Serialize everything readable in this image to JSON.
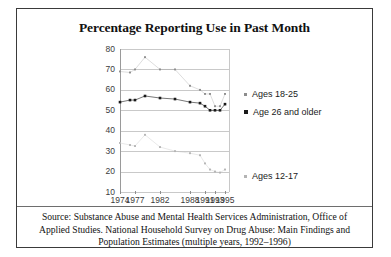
{
  "figure": {
    "title": "Percentage Reporting Use in Past Month"
  },
  "axes": {
    "y_ticks": [
      "80",
      "70",
      "60",
      "50",
      "40",
      "30",
      "20",
      "10"
    ],
    "x_ticks": [
      "1974",
      "1977",
      "1982",
      "1988",
      "1991",
      "1993",
      "1995"
    ]
  },
  "legend": {
    "items": [
      {
        "label": "Ages 18-25",
        "color": "#8c8c8c"
      },
      {
        "label": "Age 26 and older",
        "color": "#1a1a1a"
      },
      {
        "label": "Ages 12-17",
        "color": "#b4b4b4"
      }
    ]
  },
  "source": {
    "line1": "Source: Substance Abuse and Mental Health Services Administration, Office of",
    "line2": "Applied Studies.  National Household Survey on Drug Abuse: Main Findings and",
    "line3": "Population Estimates (multiple years, 1992–1996)"
  },
  "chart_data": {
    "type": "line",
    "title": "Percentage Reporting Use in Past Month",
    "xlabel": "",
    "ylabel": "",
    "xlim": [
      1974,
      1996
    ],
    "ylim": [
      10,
      80
    ],
    "ytick_step": 10,
    "grid": true,
    "legend_position": "right",
    "x": [
      1974,
      1976,
      1977,
      1979,
      1982,
      1985,
      1988,
      1990,
      1991,
      1992,
      1993,
      1994,
      1995
    ],
    "series": [
      {
        "name": "Ages 18-25",
        "color": "#8c8c8c",
        "marker": "square-small",
        "values": [
          69,
          68.5,
          70,
          76,
          70,
          70,
          62,
          60,
          58,
          58,
          52,
          52,
          58
        ]
      },
      {
        "name": "Age 26 and older",
        "color": "#1a1a1a",
        "marker": "square-filled",
        "values": [
          54,
          55,
          55,
          57,
          56,
          55.5,
          54,
          53.5,
          52,
          50,
          50,
          50,
          53
        ]
      },
      {
        "name": "Ages 12-17",
        "color": "#b4b4b4",
        "marker": "square-small",
        "values": [
          34,
          33,
          32.5,
          38,
          32,
          30,
          29,
          28,
          24,
          21,
          20,
          19.5,
          21
        ]
      }
    ]
  }
}
